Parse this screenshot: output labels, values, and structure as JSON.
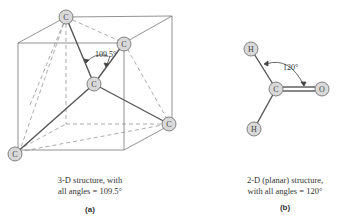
{
  "figure_a": {
    "angle_label": "109.5°",
    "atoms": [
      "C",
      "C",
      "C",
      "C",
      "C"
    ],
    "caption_line1": "3-D structure, with",
    "caption_line2": "all angles = 109.5°",
    "panel_label": "(a)"
  },
  "figure_b": {
    "angle_label": "120°",
    "atoms": [
      "H",
      "C",
      "O",
      "H"
    ],
    "caption_line1": "2-D (planar) structure,",
    "caption_line2": "with all angles = 120°",
    "panel_label": "(b)"
  },
  "colors": {
    "line": "#555555",
    "atom_fill": "#d9d9d9",
    "atom_stroke": "#666666"
  }
}
